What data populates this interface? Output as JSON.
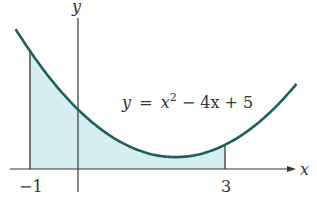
{
  "figure": {
    "equation_label": {
      "lhs": "y",
      "eq": "=",
      "x": "x",
      "sup": "2",
      "rest": " − 4x + 5"
    },
    "axis_labels": {
      "x": "x",
      "y": "y"
    },
    "tick_labels": {
      "left": "−1",
      "right": "3"
    },
    "colors": {
      "curve": "#1f5e5c",
      "fill": "#d6eef2",
      "axis": "#333333"
    }
  },
  "chart_data": {
    "type": "area",
    "title": "",
    "function": "y = x^2 - 4x + 5",
    "shaded_interval": [
      -1,
      3
    ],
    "x": [
      -1.3,
      -1,
      -0.5,
      0,
      0.5,
      1,
      1.5,
      2,
      2.5,
      3,
      3.5,
      4,
      4.5
    ],
    "y": [
      11.89,
      10,
      7.25,
      5,
      3.25,
      2,
      1.25,
      1,
      1.25,
      2,
      3.25,
      5,
      7.25
    ],
    "xlabel": "x",
    "ylabel": "y",
    "x_ticks": [
      -1,
      3
    ],
    "grid": false,
    "legend": "none"
  }
}
